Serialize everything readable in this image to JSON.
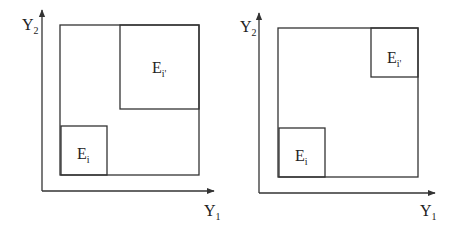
{
  "colors": {
    "stroke": "#333333",
    "text": "#222222",
    "background": "#ffffff"
  },
  "panels": [
    {
      "id": "left",
      "y_axis": {
        "label": "Y",
        "sub": "2"
      },
      "x_axis": {
        "label": "Y",
        "sub": "1"
      },
      "region_small": {
        "label": "E",
        "sub": "i"
      },
      "region_large": {
        "label": "E",
        "sub": "i'"
      }
    },
    {
      "id": "right",
      "y_axis": {
        "label": "Y",
        "sub": "2"
      },
      "x_axis": {
        "label": "Y",
        "sub": "1"
      },
      "region_small": {
        "label": "E",
        "sub": "i"
      },
      "region_large": {
        "label": "E",
        "sub": "i'"
      }
    }
  ]
}
